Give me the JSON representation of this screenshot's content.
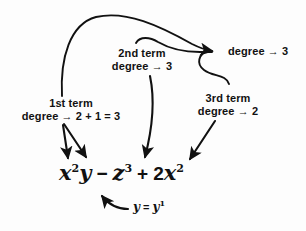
{
  "diagram": {
    "ink_color": "#111111",
    "background_color": "#fdfdfd",
    "expression": {
      "term1_base": "x",
      "term1_exp": "2",
      "term1_var": "y",
      "op1": "−",
      "term2_base": "z",
      "term2_exp": "3",
      "op2": "+",
      "term3_coef": "2",
      "term3_base": "x",
      "term3_exp": "2"
    },
    "labels": {
      "term1_line1": "1st term",
      "term1_line2": "degree → 2 + 1 = 3",
      "term2_line1": "2nd term",
      "term2_line2": "degree → 3",
      "term3_line1": "3rd term",
      "term3_line2": "degree → 2",
      "total_degree": "degree → 3"
    },
    "footnote": {
      "lhs": "y",
      "equals": "=",
      "rhs_base": "y",
      "rhs_exp": "1"
    }
  }
}
